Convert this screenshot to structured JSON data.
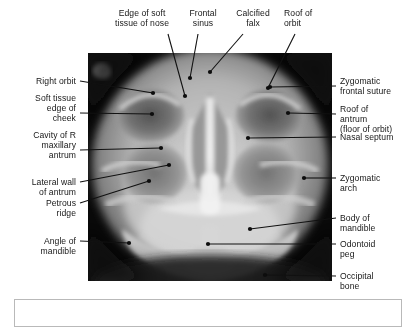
{
  "figure": {
    "kind": "annotated-radiograph",
    "modality": "plain film radiograph",
    "projection": "occipitomental (facial bones) view",
    "ink_color": "#171717",
    "leader_color": "#111111",
    "caption_box_border": "#b9b9b9"
  },
  "labels": {
    "top": [
      {
        "id": "edge-of-soft-tissue-of-nose",
        "text": "Edge of soft\ntissue of nose"
      },
      {
        "id": "frontal-sinus",
        "text": "Frontal\nsinus"
      },
      {
        "id": "calcified-falx",
        "text": "Calcified\nfalx"
      },
      {
        "id": "roof-of-orbit",
        "text": "Roof of\norbit"
      }
    ],
    "left": [
      {
        "id": "right-orbit",
        "text": "Right orbit"
      },
      {
        "id": "soft-tissue-edge-of-cheek",
        "text": "Soft tissue\nedge of\ncheek"
      },
      {
        "id": "cavity-of-r-maxillary-antrum",
        "text": "Cavity of R\nmaxillary\nantrum"
      },
      {
        "id": "lateral-wall-of-antrum",
        "text": "Lateral wall\nof antrum"
      },
      {
        "id": "petrous-ridge",
        "text": "Petrous\nridge"
      },
      {
        "id": "angle-of-mandible",
        "text": "Angle of\nmandible"
      }
    ],
    "right": [
      {
        "id": "zygomatic-frontal-suture",
        "text": "Zygomatic\nfrontal suture"
      },
      {
        "id": "roof-of-antrum",
        "text": "Roof of\nantrum\n(floor of orbit)"
      },
      {
        "id": "nasal-septum",
        "text": "Nasal septum"
      },
      {
        "id": "zygomatic-arch",
        "text": "Zygomatic\narch"
      },
      {
        "id": "body-of-mandible",
        "text": "Body of\nmandible"
      },
      {
        "id": "odontoid-peg",
        "text": "Odontoid\npeg"
      },
      {
        "id": "occipital-bone",
        "text": "Occipital\nbone"
      }
    ]
  },
  "caption": {
    "text": ""
  }
}
